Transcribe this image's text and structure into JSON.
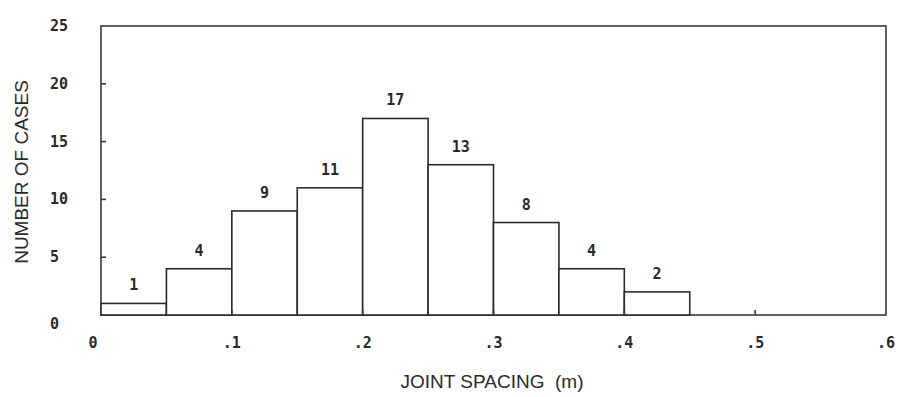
{
  "chart_data": {
    "type": "bar",
    "subtype": "histogram",
    "title": "",
    "xlabel": "JOINT SPACING  (m)",
    "ylabel": "NUMBER OF CASES",
    "bin_width": 0.05,
    "bins": [
      {
        "start": 0.0,
        "end": 0.05,
        "count": 1
      },
      {
        "start": 0.05,
        "end": 0.1,
        "count": 4
      },
      {
        "start": 0.1,
        "end": 0.15,
        "count": 9
      },
      {
        "start": 0.15,
        "end": 0.2,
        "count": 11
      },
      {
        "start": 0.2,
        "end": 0.25,
        "count": 17
      },
      {
        "start": 0.25,
        "end": 0.3,
        "count": 13
      },
      {
        "start": 0.3,
        "end": 0.35,
        "count": 8
      },
      {
        "start": 0.35,
        "end": 0.4,
        "count": 4
      },
      {
        "start": 0.4,
        "end": 0.45,
        "count": 2
      }
    ],
    "categories": [
      "0-.05",
      ".05-.1",
      ".1-.15",
      ".15-.2",
      ".2-.25",
      ".25-.3",
      ".3-.35",
      ".35-.4",
      ".4-.45"
    ],
    "values": [
      1,
      4,
      9,
      11,
      17,
      13,
      8,
      4,
      2
    ],
    "bar_labels": [
      "1",
      "4",
      "9",
      "11",
      "17",
      "13",
      "8",
      "4",
      "2"
    ],
    "xlim": [
      0,
      0.6
    ],
    "ylim": [
      0,
      25
    ],
    "x_ticks": [
      0,
      0.1,
      0.2,
      0.3,
      0.4,
      0.5,
      0.6
    ],
    "x_tick_labels": [
      "0",
      ".1",
      ".2",
      ".3",
      ".4",
      ".5",
      ".6"
    ],
    "y_ticks": [
      0,
      5,
      10,
      15,
      20,
      25
    ],
    "y_tick_labels": [
      "0",
      "5",
      "10",
      "15",
      "20",
      "25"
    ],
    "grid": false,
    "legend": null,
    "colors": {
      "bar_fill": "#ffffff",
      "bar_stroke": "#2a2a2a",
      "frame": "#3a3a3a",
      "text": "#2a2a2a"
    }
  }
}
